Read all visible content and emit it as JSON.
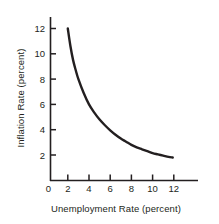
{
  "chart_data": {
    "type": "line",
    "title": "",
    "subtitle": "",
    "xlabel": "Unemployment Rate (percent)",
    "ylabel": "Inflation Rate (percent)",
    "xlim": [
      0,
      13.2
    ],
    "ylim": [
      0,
      13.0
    ],
    "xticks": [
      0,
      2,
      4,
      6,
      8,
      10,
      12
    ],
    "xtick_labels": [
      "0",
      "2",
      "4",
      "6",
      "8",
      "10",
      "12"
    ],
    "yticks": [
      2,
      4,
      6,
      8,
      10,
      12
    ],
    "ytick_labels": [
      "2",
      "4",
      "6",
      "8",
      "10",
      "12"
    ],
    "grid": false,
    "legend": null,
    "annotations": [],
    "series": [
      {
        "name": "Phillips curve",
        "color": "#231f20",
        "line_width": 2.4,
        "x": [
          2.0,
          2.25,
          2.5,
          2.75,
          3.0,
          3.5,
          4.0,
          4.5,
          5.0,
          5.5,
          6.0,
          6.5,
          7.0,
          7.5,
          8.0,
          8.5,
          9.0,
          9.5,
          10.0,
          10.5,
          11.0,
          11.5,
          11.9
        ],
        "values": [
          12.0,
          10.6,
          9.5,
          8.7,
          8.0,
          6.9,
          6.0,
          5.35,
          4.8,
          4.35,
          3.95,
          3.6,
          3.3,
          3.05,
          2.8,
          2.6,
          2.45,
          2.3,
          2.15,
          2.05,
          1.95,
          1.85,
          1.8
        ]
      }
    ]
  },
  "axis": {
    "x_title": "Unemployment Rate (percent)",
    "y_title": "Inflation Rate (percent)"
  }
}
